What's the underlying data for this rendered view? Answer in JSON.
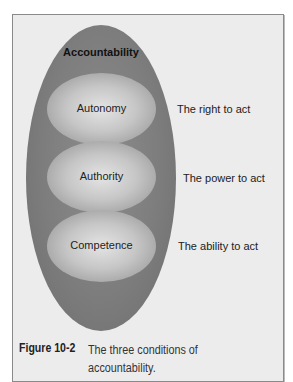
{
  "diagram": {
    "outer_label": "Accountability",
    "conditions": [
      {
        "name": "Autonomy",
        "description": "The right to act"
      },
      {
        "name": "Authority",
        "description": "The power to act"
      },
      {
        "name": "Competence",
        "description": "The ability to act"
      }
    ]
  },
  "caption": {
    "number": "Figure 10-2",
    "text_line1": "The three conditions of",
    "text_line2": "accountability."
  },
  "colors": {
    "frame_bg": "#ececec",
    "outer_ellipse": "#7d7d7d",
    "inner_ellipse": "#c6c6c6"
  }
}
